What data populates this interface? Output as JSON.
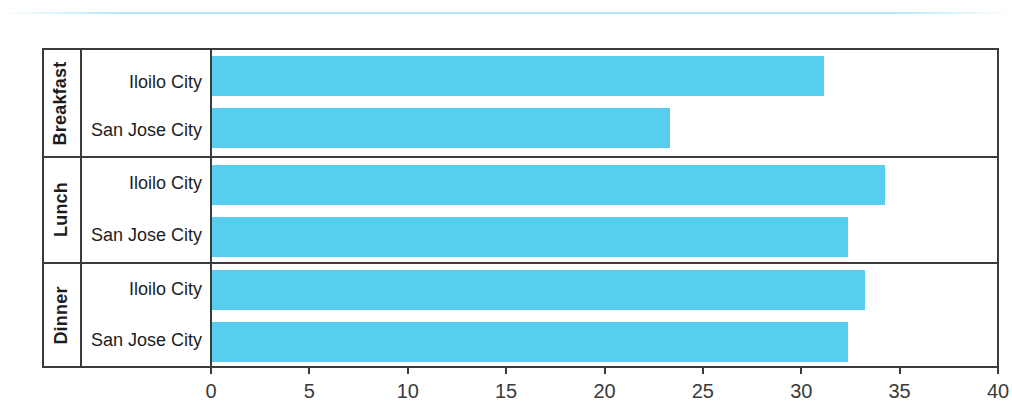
{
  "chart_data": {
    "type": "bar",
    "orientation": "horizontal",
    "title": "",
    "xlabel": "",
    "ylabel": "",
    "xlim": [
      0,
      40
    ],
    "xticks": [
      "0",
      "5",
      "10",
      "15",
      "20",
      "25",
      "30",
      "35",
      "40"
    ],
    "grid": false,
    "legend": "none",
    "bar_color": "#57CDF0",
    "groups": [
      {
        "label": "Breakfast",
        "rows": [
          {
            "category": "Iloilo City",
            "value": 31.1
          },
          {
            "category": "San Jose City",
            "value": 23.3
          }
        ]
      },
      {
        "label": "Lunch",
        "rows": [
          {
            "category": "Iloilo City",
            "value": 34.2
          },
          {
            "category": "San Jose City",
            "value": 32.3
          }
        ]
      },
      {
        "label": "Dinner",
        "rows": [
          {
            "category": "Iloilo City",
            "value": 33.2
          },
          {
            "category": "San Jose City",
            "value": 32.3
          }
        ]
      }
    ],
    "categories": [
      "Breakfast - Iloilo City",
      "Breakfast - San Jose City",
      "Lunch - Iloilo City",
      "Lunch - San Jose City",
      "Dinner - Iloilo City",
      "Dinner - San Jose City"
    ],
    "values": [
      31.1,
      23.3,
      34.2,
      32.3,
      33.2,
      32.3
    ]
  }
}
